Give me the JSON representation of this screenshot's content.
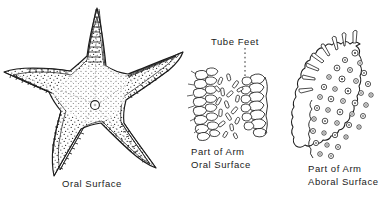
{
  "figure": {
    "background_color": "#ffffff",
    "ink_color": "#1a1a1a",
    "width": 386,
    "height": 200
  },
  "panels": {
    "whole_animal": {
      "name": "starfish-whole",
      "caption": "Oral Surface",
      "arm_count": 5,
      "features": [
        "madreporite",
        "mouth",
        "marginal-plates",
        "stippled-surface"
      ]
    },
    "arm_oral": {
      "name": "part-of-arm-oral",
      "caption_line_1": "Part of Arm",
      "caption_line_2": "Oral Surface",
      "callout": "Tube Feet",
      "features": [
        "ambulacral-groove",
        "tube-feet",
        "spines"
      ]
    },
    "arm_aboral": {
      "name": "part-of-arm-aboral",
      "caption_line_1": "Part of Arm",
      "caption_line_2": "Aboral Surface",
      "features": [
        "papulae",
        "ossicles",
        "spines",
        "scalloped-margin"
      ]
    }
  },
  "colors": {
    "ink": "#1a1a1a",
    "line": "#2b2b2b",
    "stipple": "#333333",
    "paper": "#ffffff"
  }
}
